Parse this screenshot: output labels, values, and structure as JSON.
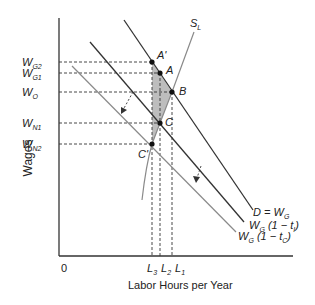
{
  "diagram": {
    "axes": {
      "y_label": "Wages",
      "x_label": "Labor Hours per Year",
      "origin": "0"
    },
    "y_ticks": [
      {
        "base": "W",
        "sub": "G2",
        "y": 62
      },
      {
        "base": "W",
        "sub": "G1",
        "y": 73
      },
      {
        "base": "W",
        "sub": "O",
        "y": 92
      },
      {
        "base": "W",
        "sub": "N1",
        "y": 123
      },
      {
        "base": "W",
        "sub": "N2",
        "y": 144
      }
    ],
    "x_ticks": [
      {
        "base": "L",
        "sub": "3",
        "x": 152
      },
      {
        "base": "L",
        "sub": "2",
        "x": 160
      },
      {
        "base": "L",
        "sub": "1",
        "x": 172
      }
    ],
    "points": [
      {
        "name": "A'",
        "x": 152,
        "y": 62
      },
      {
        "name": "A",
        "x": 160,
        "y": 73
      },
      {
        "name": "B",
        "x": 172,
        "y": 92
      },
      {
        "name": "C",
        "x": 160,
        "y": 123
      },
      {
        "name": "C'",
        "x": 152,
        "y": 144
      }
    ],
    "curves": {
      "supply": {
        "label": "S",
        "sub": "L"
      },
      "demand": {
        "label": "D = W",
        "sub": "G"
      },
      "after_tax_i": {
        "label_pre": "W",
        "sub1": "G",
        "mid": " (1 − t",
        "sub2": "I",
        "end": ")"
      },
      "after_tax_c": {
        "label_pre": "W",
        "sub1": "G",
        "mid": " (1 − t",
        "sub2": "C",
        "end": ")"
      }
    },
    "colors": {
      "line": "#333333",
      "shade": "#bdbdbd",
      "light_line": "#8a8a8a"
    }
  }
}
